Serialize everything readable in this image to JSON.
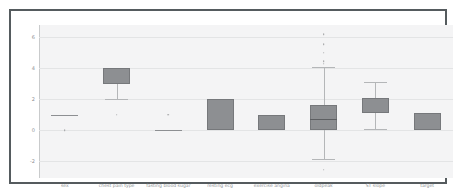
{
  "figure": {
    "background_color": "#ffffff",
    "frame_color": "#555b5e",
    "plot_background_color": "#f4f4f5",
    "grid_color": "#e3e4e5",
    "box_fill_color": "#8d8f92",
    "tick_label_color": "#8d9194"
  },
  "chart_data": {
    "type": "box",
    "title": "",
    "xlabel": "",
    "ylabel": "",
    "ylim": [
      -3.1,
      6.8
    ],
    "grid": true,
    "legend": "none",
    "yticks": [
      -2,
      0,
      2,
      4,
      6
    ],
    "ytick_labels": [
      "-2",
      "0",
      "2",
      "4",
      "6"
    ],
    "categories": [
      "sex",
      "chest pain type",
      "fasting blood sugar",
      "resting ecg",
      "exercise angina",
      "oldpeak",
      "ST slope",
      "target"
    ],
    "boxes": [
      {
        "name": "sex",
        "q1": 1.0,
        "median": 1.0,
        "q3": 1.0,
        "whisker_low": 1.0,
        "whisker_high": 1.0,
        "fliers": [
          0.0
        ],
        "collapsed": true
      },
      {
        "name": "chest pain type",
        "q1": 3.0,
        "median": 4.0,
        "q3": 4.0,
        "whisker_low": 2.0,
        "whisker_high": 4.0,
        "fliers": [
          1.0
        ],
        "collapsed": false
      },
      {
        "name": "fasting blood sugar",
        "q1": 0.0,
        "median": 0.0,
        "q3": 0.0,
        "whisker_low": 0.0,
        "whisker_high": 0.0,
        "fliers": [
          1.0
        ],
        "collapsed": true
      },
      {
        "name": "resting ecg",
        "q1": 0.0,
        "median": 0.0,
        "q3": 2.0,
        "whisker_low": 0.0,
        "whisker_high": 2.0,
        "fliers": [],
        "collapsed": false
      },
      {
        "name": "exercise angina",
        "q1": 0.0,
        "median": 0.0,
        "q3": 1.0,
        "whisker_low": 0.0,
        "whisker_high": 1.0,
        "fliers": [],
        "collapsed": false
      },
      {
        "name": "oldpeak",
        "q1": 0.0,
        "median": 0.7,
        "q3": 1.6,
        "whisker_low": -1.9,
        "whisker_high": 4.1,
        "fliers": [
          -2.55,
          4.3,
          4.45,
          5.0,
          5.55,
          6.2
        ],
        "collapsed": false
      },
      {
        "name": "ST slope",
        "q1": 1.1,
        "median": 1.1,
        "q3": 2.1,
        "whisker_low": 0.1,
        "whisker_high": 3.1,
        "fliers": [],
        "collapsed": false
      },
      {
        "name": "target",
        "q1": 0.0,
        "median": 0.0,
        "q3": 1.1,
        "whisker_low": 0.0,
        "whisker_high": 1.1,
        "fliers": [],
        "collapsed": false
      }
    ]
  }
}
